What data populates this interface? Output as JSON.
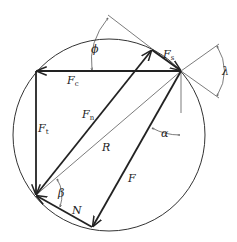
{
  "diagram": {
    "labels": {
      "fc": "F",
      "fc_sub": "c",
      "ft": "F",
      "ft_sub": "t",
      "fn": "F",
      "fn_sub": "n",
      "fs": "F",
      "fs_sub": "s",
      "r": "R",
      "f": "F",
      "n": "N",
      "phi": "ϕ",
      "lambda": "λ",
      "alpha": "α",
      "beta": "β"
    },
    "colors": {
      "stroke": "#222222",
      "thin": "#444444",
      "background": "#ffffff"
    }
  }
}
